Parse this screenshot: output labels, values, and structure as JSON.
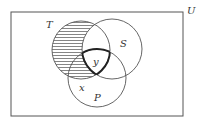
{
  "diagram": {
    "type": "venn",
    "universe": {
      "label": "U",
      "rect": {
        "x": 11,
        "y": 12,
        "w": 172,
        "h": 104
      }
    },
    "sets": [
      {
        "id": "T",
        "label": "T",
        "cx": 81,
        "cy": 50,
        "r": 29,
        "label_pos": [
          48,
          26
        ]
      },
      {
        "id": "S",
        "label": "S",
        "cx": 112,
        "cy": 49,
        "r": 30,
        "label_pos": [
          122,
          45
        ]
      },
      {
        "id": "P",
        "label": "P",
        "cx": 97,
        "cy": 78,
        "r": 29,
        "label_pos": [
          96,
          100
        ]
      }
    ],
    "region_labels": [
      {
        "label": "x",
        "pos": [
          79,
          90
        ],
        "region": "T∩P outside S"
      },
      {
        "label": "y",
        "pos": [
          95,
          64
        ],
        "region": "T∩S∩P"
      }
    ],
    "shaded_region": "T minus S (horizontal hatching)",
    "bold_region": "T∩S∩P",
    "colors": {
      "stroke": "#555555",
      "bold_stroke": "#222222",
      "hatch": "#666666",
      "background": "#ffffff"
    }
  }
}
